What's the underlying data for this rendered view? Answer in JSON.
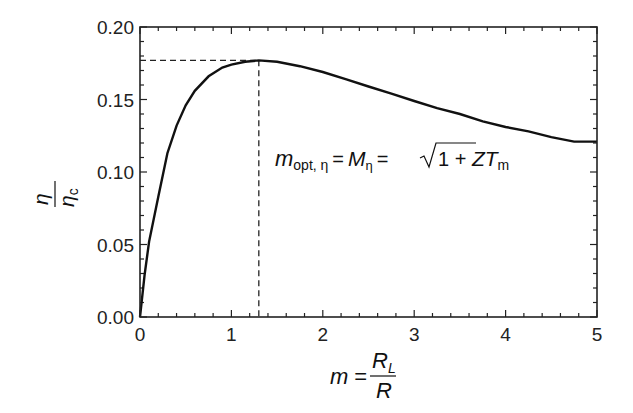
{
  "chart_data": {
    "type": "line",
    "title": "",
    "xlabel": {
      "lhs": "m",
      "eq": "=",
      "num": "R",
      "num_sub": "L",
      "den": "R"
    },
    "ylabel": {
      "num": "η",
      "den": "η",
      "den_sub": "c"
    },
    "xlim": [
      0,
      5
    ],
    "ylim": [
      0.0,
      0.2
    ],
    "xticks": [
      "0",
      "1",
      "2",
      "3",
      "4",
      "5"
    ],
    "xtick_values": [
      0,
      1,
      2,
      3,
      4,
      5
    ],
    "yticks": [
      "0.00",
      "0.05",
      "0.10",
      "0.15",
      "0.20"
    ],
    "ytick_values": [
      0.0,
      0.05,
      0.1,
      0.15,
      0.2
    ],
    "grid": false,
    "series": [
      {
        "name": "efficiency ratio",
        "x": [
          0,
          0.05,
          0.1,
          0.2,
          0.3,
          0.4,
          0.5,
          0.6,
          0.75,
          0.9,
          1.0,
          1.15,
          1.3,
          1.5,
          1.75,
          2.0,
          2.25,
          2.5,
          2.75,
          3.0,
          3.25,
          3.5,
          3.75,
          4.0,
          4.25,
          4.5,
          4.75,
          5.0
        ],
        "y": [
          0.0,
          0.029,
          0.052,
          0.083,
          0.113,
          0.132,
          0.146,
          0.156,
          0.166,
          0.172,
          0.174,
          0.176,
          0.177,
          0.176,
          0.173,
          0.169,
          0.164,
          0.159,
          0.154,
          0.149,
          0.144,
          0.14,
          0.135,
          0.131,
          0.128,
          0.124,
          0.121,
          0.121
        ]
      }
    ],
    "reference_point": {
      "x": 1.3,
      "y": 0.177
    },
    "annotation": {
      "m": "m",
      "m_sub": "opt, η",
      "eq1": "=",
      "M": "M",
      "M_sub": "η",
      "eq2": "=",
      "sqrt_body": "1 + ",
      "ZT": "ZT",
      "ZT_sub": "m"
    }
  }
}
